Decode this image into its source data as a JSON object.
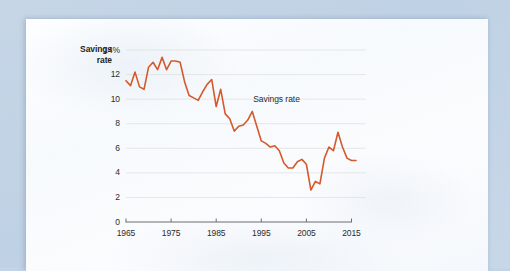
{
  "figure": {
    "background_color": "#c3d4e6",
    "card_color": "#fbfcfe"
  },
  "axis_title": {
    "line1": "Savings",
    "line2": "rate"
  },
  "annotations": [
    {
      "name": "series-label-savings-rate",
      "text": "Savings rate",
      "x": 1993.2,
      "y": 9.95
    }
  ],
  "chart_data": {
    "type": "line",
    "title": "",
    "subtitle": "",
    "xlabel": "",
    "ylabel": "Savings rate",
    "xlim": [
      1965,
      2016
    ],
    "ylim": [
      0,
      14
    ],
    "xticks": [
      1965,
      1975,
      1985,
      1995,
      2005,
      2015
    ],
    "xtick_labels": [
      "1965",
      "1975",
      "1985",
      "1995",
      "2005",
      "2015"
    ],
    "yticks": [
      0,
      2,
      4,
      6,
      8,
      10,
      12,
      14
    ],
    "ytick_labels": [
      "0",
      "2",
      "4",
      "6",
      "8",
      "10",
      "12",
      "14%"
    ],
    "grid": "horizontal",
    "legend": "inline-annotation",
    "line_color": "#d4592c",
    "line_width": 1.6,
    "series": [
      {
        "name": "Savings rate",
        "color": "#d4592c",
        "x": [
          1965,
          1966,
          1967,
          1968,
          1969,
          1970,
          1971,
          1972,
          1973,
          1974,
          1975,
          1976,
          1977,
          1978,
          1979,
          1980,
          1981,
          1982,
          1983,
          1984,
          1985,
          1986,
          1987,
          1988,
          1989,
          1990,
          1991,
          1992,
          1993,
          1994,
          1995,
          1996,
          1997,
          1998,
          1999,
          2000,
          2001,
          2002,
          2003,
          2004,
          2005,
          2006,
          2007,
          2008,
          2009,
          2010,
          2011,
          2012,
          2013,
          2014,
          2015,
          2016
        ],
        "values": [
          11.5,
          11.1,
          12.2,
          11.0,
          10.8,
          12.6,
          13.0,
          12.4,
          13.4,
          12.4,
          13.1,
          13.1,
          13.0,
          11.4,
          10.3,
          10.1,
          9.9,
          10.6,
          11.2,
          11.6,
          9.4,
          10.8,
          8.8,
          8.4,
          7.4,
          7.8,
          7.9,
          8.3,
          9.0,
          7.8,
          6.6,
          6.4,
          6.1,
          6.2,
          5.8,
          4.8,
          4.4,
          4.4,
          4.9,
          5.1,
          4.7,
          2.6,
          3.3,
          3.1,
          5.2,
          6.1,
          5.8,
          7.3,
          6.1,
          5.2,
          5.0,
          5.0
        ]
      }
    ]
  }
}
